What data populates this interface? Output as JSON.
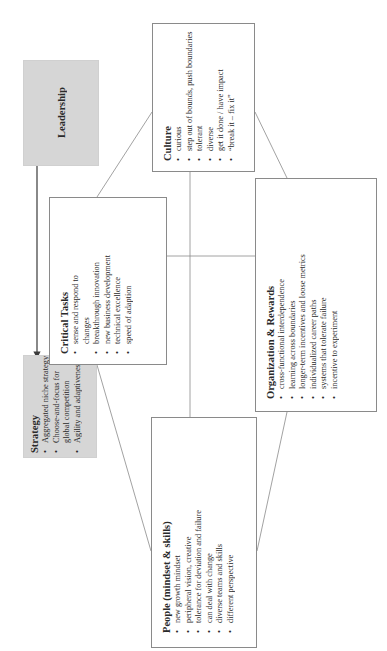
{
  "diagram": {
    "orientation": "rotated 90 degrees counter-clockwise",
    "colors": {
      "gray_box": "#d6d6d6",
      "border": "#8a8a8a",
      "line": "#8a8a8a",
      "arrow": "#3a3a3a"
    },
    "leadership": {
      "label": "Leadership"
    },
    "strategy": {
      "title": "Strategy",
      "items": [
        "Aggregated niche strategy",
        "Choose-and-focus for global competition",
        "Agility and adaptiveness"
      ]
    },
    "critical_tasks": {
      "title": "Critical Tasks",
      "items": [
        "sense and respond to changes",
        "breakthrough innovation",
        "new business development",
        "technical excellence",
        "speed of adaption"
      ]
    },
    "culture": {
      "title": "Culture",
      "items": [
        "curious",
        "step out of bounds, push boundaries",
        "tolerant",
        "diverse",
        "get it done / have impact",
        "“break it – fix it”"
      ]
    },
    "organization_rewards": {
      "title": "Organization & Rewards",
      "items": [
        "cross-functional interdependence",
        "learning across boundaries",
        "longer-term incentives and loose metrics",
        "individualized career paths",
        "systems that tolerate failure",
        "incentive to experiment"
      ]
    },
    "people": {
      "title": "People (mindset & skills)",
      "items": [
        "new growth mindset",
        "peripheral vision, creative",
        "tolerance for deviation and failure",
        "can deal with change",
        "diverse teams and skills",
        "different perspective"
      ]
    }
  }
}
